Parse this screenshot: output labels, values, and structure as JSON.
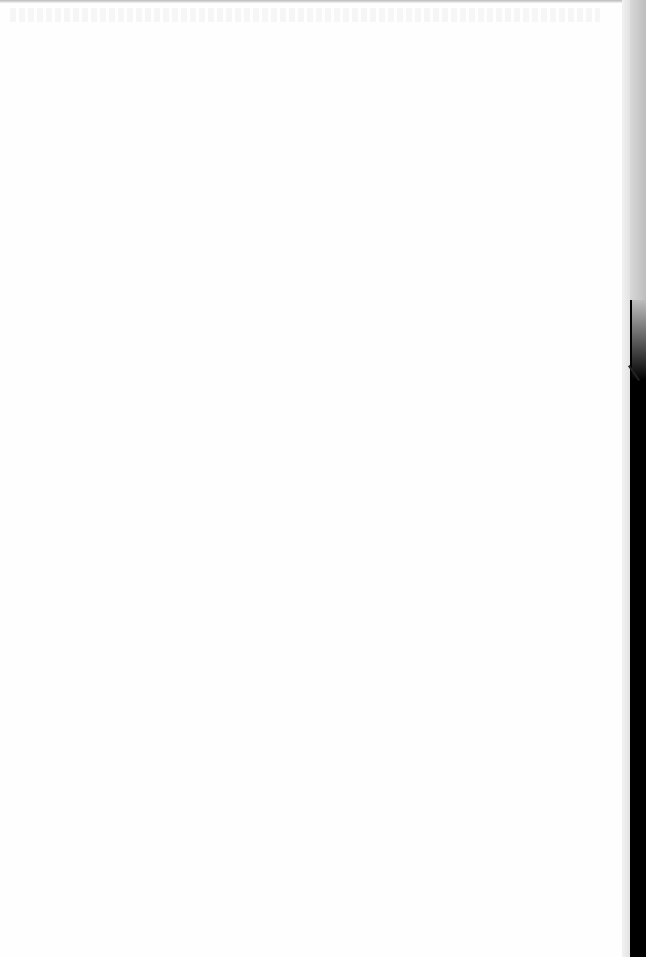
{
  "document": {
    "type": "scanned-page",
    "content": "",
    "note": ""
  }
}
